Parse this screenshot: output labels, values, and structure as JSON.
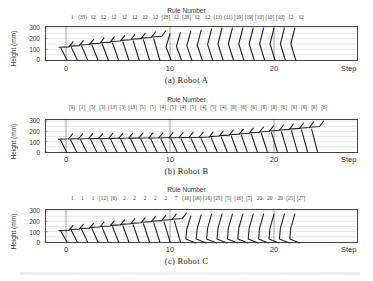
{
  "chart_data": [
    {
      "type": "line",
      "title": "Rule Number",
      "caption": "(a) Robot A",
      "xlabel": "Step",
      "ylabel": "Height (mm)",
      "xticks": [
        "0",
        "10",
        "20"
      ],
      "yticks": [
        "300",
        "200",
        "100",
        "0"
      ],
      "ylim": [
        0,
        300
      ],
      "xlim": [
        -4,
        26
      ],
      "grid": "horizontal dotted",
      "rule_numbers": [
        "1",
        "(33)",
        "12",
        "12",
        "12",
        "12",
        "12",
        "12",
        "12",
        "[28]",
        "12",
        "[28]",
        "12",
        "12",
        "(11)",
        "(11)",
        "[19]",
        "[19]",
        "[10]",
        "[10]",
        "[10]",
        "12",
        "12"
      ],
      "steps": 23,
      "description": "Stick-figure robot postures per step; body rises from ~130mm to ~300mm height"
    },
    {
      "type": "line",
      "title": "Rule Number",
      "caption": "(b) Robot B",
      "xlabel": "Step",
      "ylabel": "Height (mm)",
      "xticks": [
        "0",
        "10",
        "20"
      ],
      "yticks": [
        "300",
        "200",
        "100",
        "0"
      ],
      "ylim": [
        0,
        300
      ],
      "xlim": [
        -4,
        26
      ],
      "grid": "horizontal dotted",
      "rule_numbers": [
        "[9]",
        "[1]",
        "[5]",
        "[3]",
        "[13]",
        "[3]",
        "[13]",
        "[5]",
        "[5]",
        "[4]",
        "[5]",
        "[4]",
        "[5]",
        "[4]",
        "[5]",
        "[4]",
        "[6]",
        "[6]",
        "[6]",
        "[6]",
        "[6]",
        "[6]",
        "[6]",
        "[6]",
        "[6]",
        "[6]"
      ],
      "steps": 26,
      "description": "Stick-figure robot postures per step; body stays ~130-150mm then rises to ~260mm"
    },
    {
      "type": "line",
      "title": "Rule Number",
      "caption": "(c) Robot C",
      "xlabel": "Step",
      "ylabel": "Height (mm)",
      "xticks": [
        "0",
        "10",
        "20"
      ],
      "yticks": [
        "300",
        "200",
        "100",
        "0"
      ],
      "ylim": [
        0,
        300
      ],
      "xlim": [
        -4,
        26
      ],
      "grid": "horizontal dotted",
      "rule_numbers": [
        "1",
        "1",
        "1",
        "[12]",
        "(6)",
        "2",
        "2",
        "2",
        "2",
        "2",
        "7",
        "[16]",
        "[16]",
        "[16]",
        "[25]",
        "[5]",
        "[16]",
        "[5]",
        "20",
        "20",
        "20",
        "[25]",
        "[27]"
      ],
      "steps": 23,
      "description": "Stick-figure robot postures per step; body rises from ~120mm to ~270mm"
    }
  ],
  "colors": {
    "line": "#222222",
    "grid": "#bbbbbb",
    "axis": "#444444"
  }
}
